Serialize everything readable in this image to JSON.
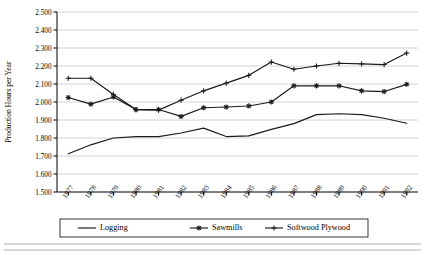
{
  "chart_data": {
    "type": "line",
    "title": "",
    "xlabel": "",
    "ylabel": "Production Hours per Year",
    "x": [
      1977,
      1978,
      1979,
      1980,
      1981,
      1982,
      1983,
      1984,
      1985,
      1986,
      1987,
      1988,
      1989,
      1990,
      1991,
      1992
    ],
    "categories": [
      "1977",
      "1978",
      "1979",
      "1980",
      "1981",
      "1982",
      "1983",
      "1984",
      "1985",
      "1986",
      "1987",
      "1988",
      "1989",
      "1990",
      "1991",
      "1992"
    ],
    "ylim": [
      1500,
      2500
    ],
    "ytick_step": 100,
    "ytick_labels": [
      "1.500",
      "1.600",
      "1.700",
      "1.800",
      "1.900",
      "2.000",
      "2.100",
      "2.200",
      "2.300",
      "2.400",
      "2.500"
    ],
    "ytick_values": [
      1500,
      1600,
      1700,
      1800,
      1900,
      2000,
      2100,
      2200,
      2300,
      2400,
      2500
    ],
    "grid": "horizontal",
    "legend_position": "bottom",
    "series": [
      {
        "name": "Logging",
        "marker": "none",
        "values": [
          1712,
          1762,
          1800,
          1808,
          1808,
          1828,
          1855,
          1808,
          1812,
          1848,
          1880,
          1930,
          1935,
          1930,
          1910,
          1882
        ]
      },
      {
        "name": "Sawmills",
        "marker": "asterisk",
        "values": [
          2025,
          1988,
          2028,
          1958,
          1958,
          1920,
          1968,
          1972,
          1978,
          2000,
          2090,
          2090,
          2090,
          2062,
          2058,
          2098
        ]
      },
      {
        "name": "Softwood Plywood",
        "marker": "plus",
        "values": [
          2132,
          2132,
          2042,
          1958,
          1955,
          2010,
          2062,
          2105,
          2148,
          2222,
          2182,
          2200,
          2215,
          2212,
          2208,
          2272
        ]
      }
    ]
  },
  "legend": {
    "items": [
      {
        "label": "Logging",
        "marker": "none"
      },
      {
        "label": "Sawmills",
        "marker": "asterisk"
      },
      {
        "label": "Softwood Plywood",
        "marker": "plus"
      }
    ]
  },
  "colors": {
    "series": "#1a1a1a",
    "grid": "#c9c9c9",
    "axis": "#000000",
    "background": "#ffffff"
  }
}
